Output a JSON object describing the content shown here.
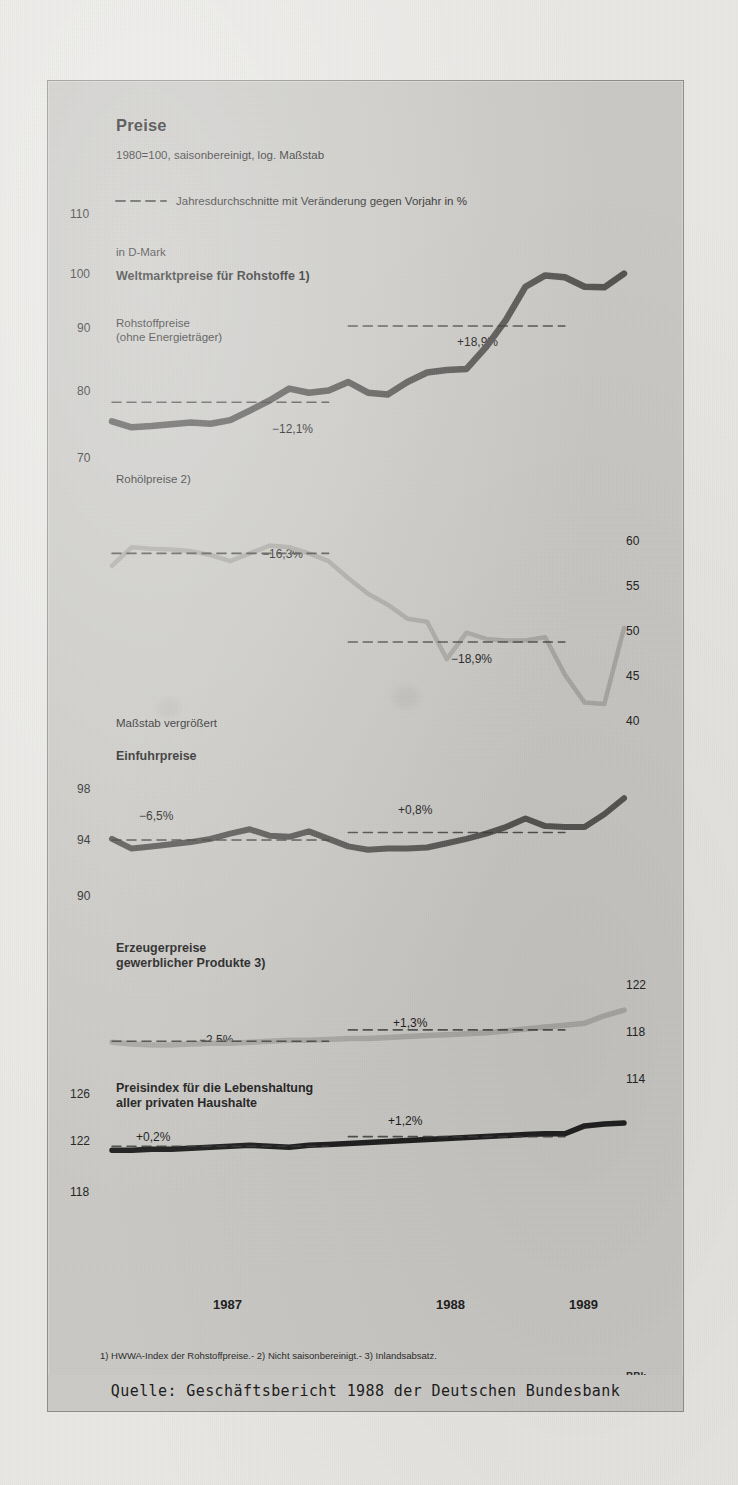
{
  "figure": {
    "title": "Preise",
    "subtitle": "1980=100, saisonbereinigt, log. Maßstab",
    "legend": "Jahresdurchschnitte mit Veränderung gegen Vorjahr in %",
    "currency_note": "in D-Mark",
    "watermark": "BBk",
    "source": "Quelle: Geschäftsbericht 1988 der Deutschen Bundesbank",
    "footnotes": "1) HWWA-Index der Rohstoffpreise.- 2) Nicht saisonbereinigt.- 3) Inlandsabsatz.",
    "years": [
      "1987",
      "1988",
      "1989"
    ],
    "panel_labels": {
      "p1_main": "Weltmarktpreise für Rohstoffe 1)",
      "p1_sub": "Rohstoffpreise\n(ohne Energieträger)",
      "p2_main": "Rohölpreise 2)",
      "p3_note": "Maßstab vergrößert",
      "p3_main": "Einfuhrpreise",
      "p4_main": "Erzeugerpreise\ngewerblicher Produkte 3)",
      "p5_main": "Preisindex für die Lebenshaltung\naller privaten Haushalte"
    },
    "colors": {
      "panel_bg": "#c9c8c4",
      "page_bg": "#e9e8e5",
      "series_dark": "#555452",
      "series_light": "#a9a8a4",
      "series_black": "#1e1e1e",
      "dash": "#3a3a3a",
      "frame": "#8e8d8a"
    }
  },
  "chart_data": [
    {
      "type": "line",
      "title": "Weltmarktpreise für Rohstoffe 1)",
      "subtitle": "Rohstoffpreise (ohne Energieträger)",
      "ylabel": "1980=100",
      "xlabel": "",
      "yticks": [
        110,
        100,
        90,
        80,
        70
      ],
      "ylim": [
        68,
        112
      ],
      "grid": false,
      "axis_side": "left",
      "x": [
        "1987-01",
        "1987-02",
        "1987-03",
        "1987-04",
        "1987-05",
        "1987-06",
        "1987-07",
        "1987-08",
        "1987-09",
        "1987-10",
        "1987-11",
        "1987-12",
        "1988-01",
        "1988-02",
        "1988-03",
        "1988-04",
        "1988-05",
        "1988-06",
        "1988-07",
        "1988-08",
        "1988-09",
        "1988-10",
        "1988-11",
        "1988-12",
        "1989-01",
        "1989-02",
        "1989-03"
      ],
      "values": [
        75.0,
        74.0,
        74.2,
        74.5,
        74.8,
        74.6,
        75.2,
        76.8,
        78.5,
        80.5,
        79.8,
        80.2,
        81.6,
        79.8,
        79.5,
        81.6,
        83.2,
        83.6,
        83.8,
        87.5,
        92.0,
        97.6,
        99.5,
        99.2,
        97.6,
        97.5,
        99.8
      ],
      "annotations": [
        {
          "label": "−12,1%",
          "value": 78.2,
          "x_from": "1987-01",
          "x_to": "1987-12",
          "style": "dashed"
        },
        {
          "label": "+18,9%",
          "value": 91.0,
          "x_from": "1988-01",
          "x_to": "1988-12",
          "style": "dashed"
        }
      ]
    },
    {
      "type": "line",
      "title": "Rohölpreise 2)",
      "ylabel": "1980=100",
      "xlabel": "",
      "yticks": [
        60,
        55,
        50,
        45,
        40
      ],
      "ylim": [
        37,
        63
      ],
      "grid": false,
      "axis_side": "right",
      "x": [
        "1987-01",
        "1987-02",
        "1987-03",
        "1987-04",
        "1987-05",
        "1987-06",
        "1987-07",
        "1987-08",
        "1987-09",
        "1987-10",
        "1987-11",
        "1987-12",
        "1988-01",
        "1988-02",
        "1988-03",
        "1988-04",
        "1988-05",
        "1988-06",
        "1988-07",
        "1988-08",
        "1988-09",
        "1988-10",
        "1988-11",
        "1988-12",
        "1989-01",
        "1989-02",
        "1989-03"
      ],
      "values": [
        58.0,
        60.4,
        60.2,
        60.1,
        59.9,
        59.4,
        58.6,
        59.6,
        60.6,
        60.4,
        59.6,
        58.6,
        56.4,
        54.4,
        53.0,
        51.2,
        50.8,
        46.0,
        49.4,
        48.6,
        48.4,
        48.4,
        48.8,
        44.0,
        40.4,
        40.2,
        50.0
      ],
      "annotations": [
        {
          "label": "−16,3%",
          "value": 59.6,
          "x_from": "1987-01",
          "x_to": "1987-12",
          "style": "dashed"
        },
        {
          "label": "−18,9%",
          "value": 48.2,
          "x_from": "1988-01",
          "x_to": "1988-12",
          "style": "dashed"
        }
      ]
    },
    {
      "type": "line",
      "title": "Einfuhrpreise",
      "note": "Maßstab vergrößert",
      "ylabel": "1980=100",
      "xlabel": "",
      "yticks": [
        98,
        94,
        90
      ],
      "ylim": [
        88.5,
        99.5
      ],
      "grid": false,
      "axis_side": "left",
      "x": [
        "1987-01",
        "1987-02",
        "1987-03",
        "1987-04",
        "1987-05",
        "1987-06",
        "1987-07",
        "1987-08",
        "1987-09",
        "1987-10",
        "1987-11",
        "1987-12",
        "1988-01",
        "1988-02",
        "1988-03",
        "1988-04",
        "1988-05",
        "1988-06",
        "1988-07",
        "1988-08",
        "1988-09",
        "1988-10",
        "1988-11",
        "1988-12",
        "1989-01",
        "1989-02",
        "1989-03"
      ],
      "values": [
        94.1,
        93.2,
        93.4,
        93.6,
        93.8,
        94.1,
        94.6,
        95.0,
        94.4,
        94.3,
        94.8,
        94.1,
        93.4,
        93.1,
        93.2,
        93.2,
        93.3,
        93.7,
        94.1,
        94.6,
        95.2,
        96.0,
        95.3,
        95.2,
        95.2,
        96.4,
        97.9
      ],
      "annotations": [
        {
          "label": "−6,5%",
          "value": 94.0,
          "x_from": "1987-01",
          "x_to": "1987-12",
          "style": "dashed"
        },
        {
          "label": "+0,8%",
          "value": 94.7,
          "x_from": "1988-01",
          "x_to": "1988-12",
          "style": "dashed"
        }
      ]
    },
    {
      "type": "line",
      "title": "Erzeugerpreise gewerblicher Produkte 3)",
      "ylabel": "1980=100",
      "xlabel": "",
      "yticks": [
        122,
        118,
        114
      ],
      "ylim": [
        112.5,
        123.5
      ],
      "grid": false,
      "axis_side": "right",
      "x": [
        "1987-01",
        "1987-02",
        "1987-03",
        "1987-04",
        "1987-05",
        "1987-06",
        "1987-07",
        "1987-08",
        "1987-09",
        "1987-10",
        "1987-11",
        "1987-12",
        "1988-01",
        "1988-02",
        "1988-03",
        "1988-04",
        "1988-05",
        "1988-06",
        "1988-07",
        "1988-08",
        "1988-09",
        "1988-10",
        "1988-11",
        "1988-12",
        "1989-01",
        "1989-02",
        "1989-03"
      ],
      "values": [
        116.6,
        116.4,
        116.3,
        116.3,
        116.4,
        116.5,
        116.5,
        116.6,
        116.7,
        116.8,
        116.8,
        116.9,
        117.0,
        117.0,
        117.1,
        117.2,
        117.3,
        117.4,
        117.5,
        117.6,
        117.8,
        118.0,
        118.2,
        118.4,
        118.6,
        119.4,
        120.0
      ],
      "annotations": [
        {
          "label": "−2,5%",
          "value": 116.7,
          "x_from": "1987-01",
          "x_to": "1987-12",
          "style": "dashed"
        },
        {
          "label": "+1,3%",
          "value": 117.9,
          "x_from": "1988-01",
          "x_to": "1988-12",
          "style": "dashed"
        }
      ]
    },
    {
      "type": "line",
      "title": "Preisindex für die Lebenshaltung aller privaten Haushalte",
      "ylabel": "1980=100",
      "xlabel": "",
      "yticks": [
        126,
        122,
        118
      ],
      "ylim": [
        116.5,
        127.5
      ],
      "grid": false,
      "axis_side": "left",
      "x": [
        "1987-01",
        "1987-02",
        "1987-03",
        "1987-04",
        "1987-05",
        "1987-06",
        "1987-07",
        "1987-08",
        "1987-09",
        "1987-10",
        "1987-11",
        "1987-12",
        "1988-01",
        "1988-02",
        "1988-03",
        "1988-04",
        "1988-05",
        "1988-06",
        "1988-07",
        "1988-08",
        "1988-09",
        "1988-10",
        "1988-11",
        "1988-12",
        "1989-01",
        "1989-02",
        "1989-03"
      ],
      "values": [
        120.9,
        120.9,
        121.0,
        121.0,
        121.1,
        121.2,
        121.3,
        121.4,
        121.3,
        121.2,
        121.4,
        121.5,
        121.6,
        121.7,
        121.8,
        121.9,
        122.0,
        122.1,
        122.2,
        122.3,
        122.4,
        122.5,
        122.6,
        122.6,
        123.4,
        123.6,
        123.7
      ],
      "annotations": [
        {
          "label": "+0,2%",
          "value": 121.3,
          "x_from": "1987-01",
          "x_to": "1987-12",
          "style": "dashed"
        },
        {
          "label": "+1,2%",
          "value": 122.3,
          "x_from": "1988-01",
          "x_to": "1988-12",
          "style": "dashed"
        }
      ]
    }
  ],
  "axis_text": {
    "p1_left": [
      "110",
      "100",
      "90",
      "80",
      "70"
    ],
    "p2_right": [
      "60",
      "55",
      "50",
      "45",
      "40"
    ],
    "p3_left": [
      "98",
      "94",
      "90"
    ],
    "p4_right": [
      "122",
      "118",
      "114"
    ],
    "p5_left": [
      "126",
      "122",
      "118"
    ]
  },
  "pct_labels": {
    "p1_a": "−12,1%",
    "p1_b": "+18,9%",
    "p2_a": "−16,3%",
    "p2_b": "−18,9%",
    "p3_a": "−6,5%",
    "p3_b": "+0,8%",
    "p4_a": "−2,5%",
    "p4_b": "+1,3%",
    "p5_a": "+0,2%",
    "p5_b": "+1,2%"
  }
}
